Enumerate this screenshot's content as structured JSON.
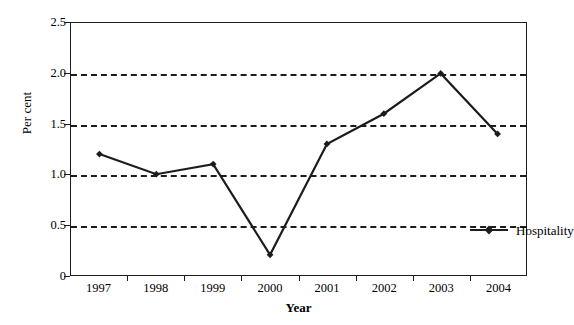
{
  "caption_fragment": "·  ·                              ·      ·        ·                        ·            ·  ·",
  "colors": {
    "line": "#1c1c1c",
    "marker": "#1c1c1c",
    "grid": "#1c1c1c",
    "axis": "#1c1c1c",
    "background": "#ffffff"
  },
  "legend": {
    "position": "inside-right",
    "entries": [
      {
        "name": "Hospitality",
        "marker": "diamond"
      }
    ]
  },
  "chart_data": {
    "type": "line",
    "title": "",
    "subtitle": "",
    "xlabel": "Year",
    "ylabel": "Per cent",
    "categories": [
      "1997",
      "1998",
      "1999",
      "2000",
      "2001",
      "2002",
      "2003",
      "2004"
    ],
    "series": [
      {
        "name": "Hospitality",
        "values": [
          1.2,
          1.0,
          1.1,
          0.2,
          1.3,
          1.6,
          2.0,
          1.4
        ]
      }
    ],
    "ylim": [
      0,
      2.5
    ],
    "ytick_labels": [
      "0",
      "0.5",
      "1.0",
      "1.5",
      "2.0",
      "2.5"
    ],
    "ytick_values": [
      0,
      0.5,
      1.0,
      1.5,
      2.0,
      2.5
    ],
    "ytick_interval": 0.5,
    "gridlines_at": [
      0.5,
      1.0,
      1.5,
      2.0
    ],
    "grid": "horizontal-dashed",
    "legend_position": "inside-right",
    "marker": "diamond",
    "annotations": []
  }
}
